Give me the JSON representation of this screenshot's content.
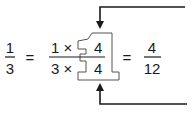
{
  "equation": {
    "lhs": {
      "numerator": "1",
      "denominator": "3"
    },
    "equals_1": "=",
    "middle": {
      "numerator_factor": "1 ×",
      "denominator_factor": "3 ×",
      "numerator_mult": "4",
      "denominator_mult": "4"
    },
    "equals_2": "=",
    "rhs": {
      "numerator": "4",
      "denominator": "12"
    }
  },
  "annotations": {
    "highlight_shape": "one-shaped outline around 4/4",
    "arrows": [
      "top arrow pointing down to 4/4",
      "bottom arrow pointing up to 4/4"
    ]
  },
  "colors": {
    "ink": "#1a1a1a",
    "background": "#ffffff"
  }
}
